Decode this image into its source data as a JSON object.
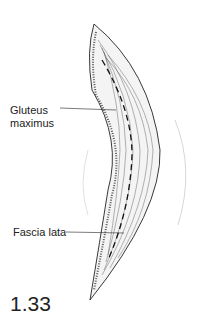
{
  "figure": {
    "number": "1.33",
    "labels": {
      "gluteus": "Gluteus",
      "gluteus2": "maximus",
      "fascia": "Fascia lata"
    }
  }
}
